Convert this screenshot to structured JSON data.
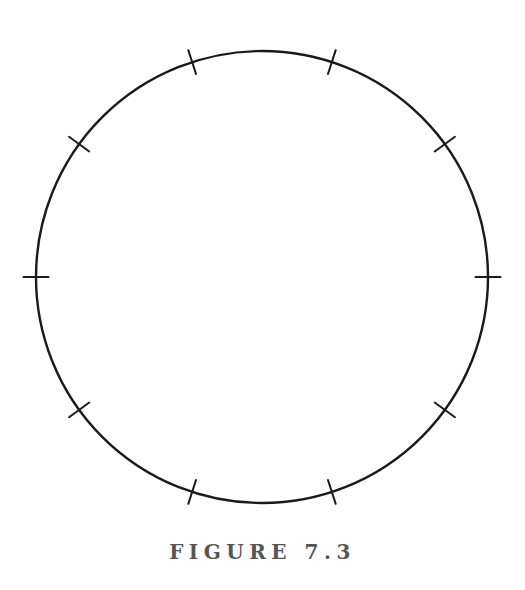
{
  "figure": {
    "caption": "FIGURE 7.3",
    "caption_color": "#555555",
    "background_color": "#ffffff",
    "stroke_color": "#1a1a1a"
  },
  "chart_data": {
    "type": "scatter",
    "title": "FIGURE 7.3",
    "subtitle": "",
    "xlabel": "",
    "ylabel": "",
    "grid": false,
    "legend": null,
    "axes": false,
    "geometry": {
      "shape": "circle",
      "center_x": 262,
      "center_y": 277,
      "radius": 226,
      "stroke_width": 2.4,
      "stroke_color": "#1a1a1a",
      "fill": "none"
    },
    "ticks": {
      "count": 10,
      "spacing_degrees": 36,
      "offset_degrees": 18,
      "length": 25,
      "inner_extent": 12.5,
      "outer_extent": 12.5,
      "stroke_width": 2.0,
      "orientation": "radial",
      "labels": [],
      "angles_degrees": [
        18,
        54,
        90,
        126,
        162,
        198,
        234,
        270,
        306,
        342
      ]
    },
    "annotations": [
      {
        "text": "FIGURE 7.3",
        "x": 262,
        "y": 557,
        "role": "caption"
      }
    ]
  }
}
